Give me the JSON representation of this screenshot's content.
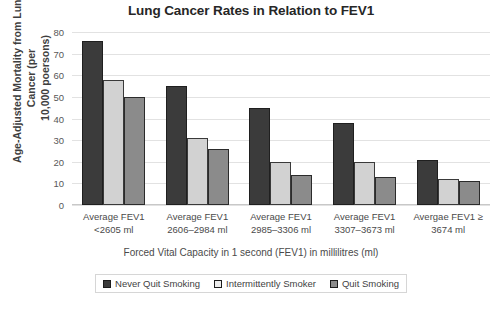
{
  "chart_data": {
    "type": "bar",
    "title": "Lung Cancer Rates in Relation to FEV1",
    "xlabel": "Forced Vital Capacity in 1 second (FEV1) in millilitres (ml)",
    "ylabel_line1": "Age-Adjusted Mortality from Lung Cancer (per",
    "ylabel_line2": "10,000 poersons)",
    "ylim": [
      0,
      80
    ],
    "yticks": [
      80,
      70,
      60,
      50,
      40,
      30,
      20,
      10,
      0
    ],
    "grid": true,
    "legend_position": "bottom",
    "categories": [
      {
        "line1": "Average FEV1",
        "line2": "<2605 ml"
      },
      {
        "line1": "Average FEV1",
        "line2": "2606–2984 ml"
      },
      {
        "line1": "Average FEV1",
        "line2": "2985–3306 ml"
      },
      {
        "line1": "Average FEV1",
        "line2": "3307–3673 ml"
      },
      {
        "line1": "Avergae FEV1 ≥",
        "line2": "3674 ml"
      }
    ],
    "series": [
      {
        "name": "Never Quit Smoking",
        "color": "#3b3b3b",
        "values": [
          76,
          55,
          45,
          38,
          21
        ]
      },
      {
        "name": "Intermittently Smoker",
        "color": "#d2d2d2",
        "values": [
          58,
          31,
          20,
          20,
          12
        ]
      },
      {
        "name": "Quit Smoking",
        "color": "#8b8b8b",
        "values": [
          50,
          26,
          14,
          13,
          11
        ]
      }
    ]
  }
}
